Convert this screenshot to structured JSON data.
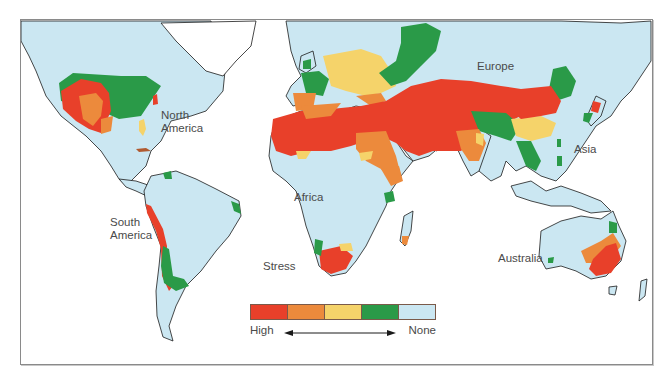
{
  "map": {
    "title": "Stress",
    "labels": {
      "north_america_line1": "North",
      "north_america_line2": "America",
      "south_america_line1": "South",
      "south_america_line2": "America",
      "africa": "Africa",
      "europe": "Europe",
      "asia": "Asia",
      "australia": "Australia",
      "stress": "Stress"
    },
    "colors": {
      "ocean": "#ffffff",
      "land": "#cbe7f2",
      "outline": "#1a1a1a",
      "frame": "#8a8a8a"
    }
  },
  "legend": {
    "title": "Stress",
    "low_end_label": "High",
    "high_end_label": "None",
    "levels": [
      {
        "name": "High",
        "color": "#e8402a"
      },
      {
        "name": "Moderately high",
        "color": "#ec8a3c"
      },
      {
        "name": "Moderate",
        "color": "#f5d36a"
      },
      {
        "name": "Low",
        "color": "#2a9a48"
      },
      {
        "name": "None",
        "color": "#cbe7f2"
      }
    ]
  }
}
